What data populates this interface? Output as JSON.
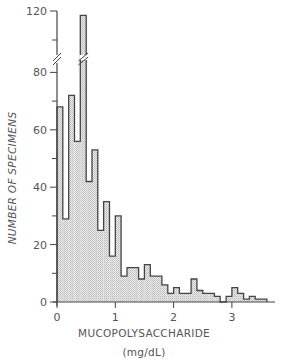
{
  "chart_data": {
    "type": "bar",
    "subtype": "histogram",
    "title": "",
    "xlabel": "MUCOPOLYSACCHARIDE",
    "xlabel_units": "(mg/dL)",
    "ylabel": "NUMBER OF SPECIMENS",
    "bin_width": 0.1,
    "bin_start": 0.0,
    "xlim": [
      0,
      3.7
    ],
    "ylim": [
      0,
      120
    ],
    "y_axis_break": {
      "between": [
        80,
        100
      ],
      "note": "axis broken between 80 and 100"
    },
    "x_ticks": [
      0,
      1,
      2,
      3
    ],
    "x_tick_labels": [
      "0",
      "1",
      "2",
      "3"
    ],
    "y_ticks": [
      0,
      20,
      40,
      60,
      80,
      120
    ],
    "y_tick_labels": [
      "0",
      "20",
      "40",
      "60",
      "80",
      "120"
    ],
    "y_minor_ticks": [
      10,
      30,
      50,
      70,
      100
    ],
    "categories": [
      "0.0-0.1",
      "0.1-0.2",
      "0.2-0.3",
      "0.3-0.4",
      "0.4-0.5",
      "0.5-0.6",
      "0.6-0.7",
      "0.7-0.8",
      "0.8-0.9",
      "0.9-1.0",
      "1.0-1.1",
      "1.1-1.2",
      "1.2-1.3",
      "1.3-1.4",
      "1.4-1.5",
      "1.5-1.6",
      "1.6-1.7",
      "1.7-1.8",
      "1.8-1.9",
      "1.9-2.0",
      "2.0-2.1",
      "2.1-2.2",
      "2.2-2.3",
      "2.3-2.4",
      "2.4-2.5",
      "2.5-2.6",
      "2.6-2.7",
      "2.7-2.8",
      "2.8-2.9",
      "2.9-3.0",
      "3.0-3.1",
      "3.1-3.2",
      "3.2-3.3",
      "3.3-3.4",
      "3.4-3.5",
      "3.5-3.6"
    ],
    "values": [
      68,
      29,
      72,
      56,
      117,
      42,
      53,
      25,
      35,
      16,
      30,
      9,
      12,
      12,
      8,
      13,
      9,
      9,
      6,
      3,
      5,
      3,
      3,
      8,
      4,
      3,
      3,
      2,
      0,
      2,
      5,
      3,
      1,
      2,
      1,
      1
    ],
    "grid": false,
    "legend": null,
    "fill": "stippled light gray",
    "colors": {
      "line": "#444444",
      "fill": "#d9d9d9",
      "background": "#ffffff"
    }
  }
}
